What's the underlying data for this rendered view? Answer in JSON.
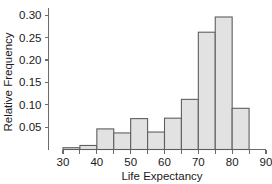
{
  "chart_data": {
    "type": "bar",
    "title": "",
    "xlabel": "Life Expectancy",
    "ylabel": "Relative Frequency",
    "xlim": [
      30,
      90
    ],
    "ylim": [
      0,
      0.312
    ],
    "grid": false,
    "legend": null,
    "bin_width": 5,
    "xticks": [
      30,
      40,
      50,
      60,
      70,
      80,
      90
    ],
    "xtick_labels": [
      "30",
      "40",
      "50",
      "60",
      "70",
      "80",
      "90"
    ],
    "yticks": [
      0.05,
      0.1,
      0.15,
      0.2,
      0.25,
      0.3
    ],
    "ytick_labels": [
      "0.05",
      "0.10",
      "0.15",
      "0.20",
      "0.25",
      "0.30"
    ],
    "bin_edges": [
      30,
      35,
      40,
      45,
      50,
      55,
      60,
      65,
      70,
      75,
      80,
      85
    ],
    "categories": [
      "30-35",
      "35-40",
      "40-45",
      "45-50",
      "50-55",
      "55-60",
      "60-65",
      "65-70",
      "70-75",
      "75-80",
      "80-85"
    ],
    "values": [
      0.004,
      0.009,
      0.046,
      0.037,
      0.069,
      0.039,
      0.07,
      0.112,
      0.262,
      0.296,
      0.092
    ],
    "bar_fill_color": "#e2e2e2",
    "bar_edge_color": "#5f5f5f",
    "axis_color": "#6b6b6b",
    "text_color": "#1a1a1a",
    "background_color": "#ffffff"
  }
}
